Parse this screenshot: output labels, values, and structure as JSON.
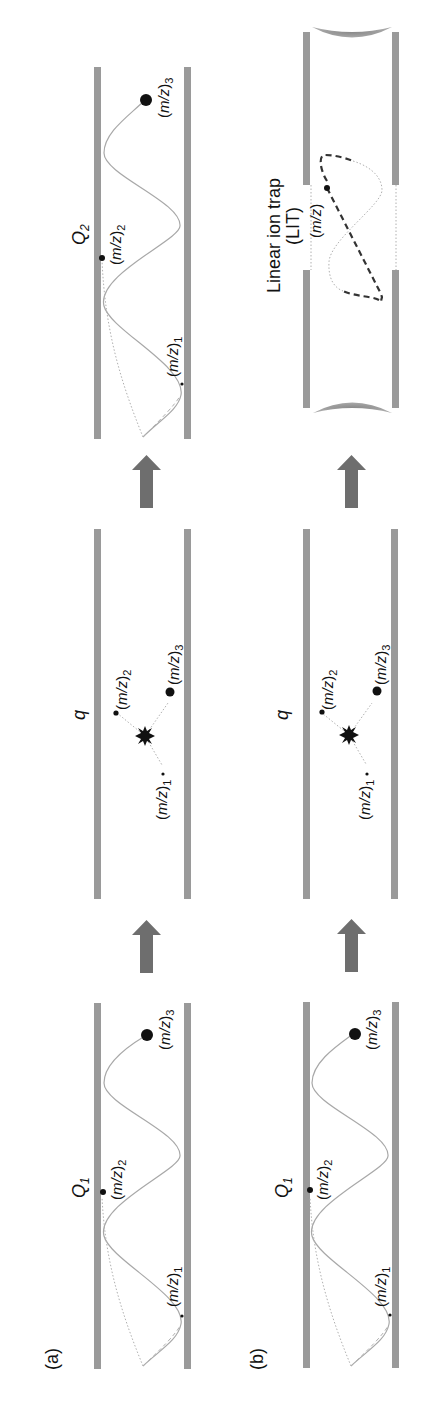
{
  "figure": {
    "orientation": "rotated 90° counter-clockwise",
    "panel_a": {
      "label": "(a)",
      "stages": [
        {
          "name": "Q",
          "subscript": "1",
          "ions": [
            "(m/z)1",
            "(m/z)2",
            "(m/z)3"
          ]
        },
        {
          "name": "q",
          "ions": [
            "(m/z)1",
            "(m/z)2",
            "(m/z)3"
          ]
        },
        {
          "name": "Q",
          "subscript": "2",
          "ions": [
            "(m/z)1",
            "(m/z)2",
            "(m/z)3"
          ]
        }
      ]
    },
    "panel_b": {
      "label": "(b)",
      "stages": [
        {
          "name": "Q",
          "subscript": "1",
          "ions": [
            "(m/z)1",
            "(m/z)2",
            "(m/z)3"
          ]
        },
        {
          "name": "q",
          "ions": [
            "(m/z)1",
            "(m/z)2",
            "(m/z)3"
          ]
        },
        {
          "name": "Linear ion trap",
          "abbr": "(LIT)",
          "ions": [
            "(m/z)"
          ]
        }
      ]
    },
    "labels": {
      "a": "(a)",
      "b": "(b)",
      "Q": "Q",
      "sub1": "1",
      "sub2": "2",
      "q": "q",
      "mz_open": "(",
      "mz_m": "m",
      "mz_slash_z": "/z",
      "mz_close": ")",
      "idx1": "1",
      "idx2": "2",
      "idx3": "3",
      "lit_line1": "Linear ion trap",
      "lit_line2": "(LIT)"
    },
    "colors": {
      "rod": "#9a9a9a",
      "arrow": "#6e6e6e",
      "trajectory": "#a8a8a8",
      "ion": "#111111"
    }
  }
}
